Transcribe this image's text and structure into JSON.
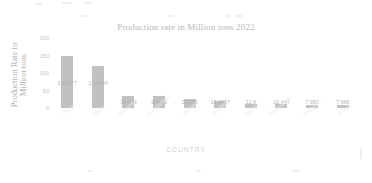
{
  "artifacts": {
    "note": "faint scan bleed marks"
  },
  "chart_data": {
    "type": "bar",
    "title": "Production rate in Million tons 2022",
    "xlabel": "COUNTRY",
    "ylabel": "Production Rate  in Million tons",
    "categories": [
      "China",
      "India",
      "Indonesia",
      "Bangladesh",
      "Vietnam",
      "Thailand",
      "Burma",
      "Philippines",
      "Pakistan",
      "Brazil"
    ],
    "values": [
      148.277,
      120.444,
      34.456,
      34.472,
      26.731,
      19.4617,
      12.6,
      10.447,
      7.992,
      7.666
    ],
    "value_labels": [
      "148.277",
      "120.444",
      "34.456",
      "34.472",
      "26.731",
      "19.4617",
      "12.6",
      "10.447",
      "7.992",
      "7.666"
    ],
    "yticks": [
      0,
      50,
      100,
      150,
      200
    ],
    "ytick_labels": [
      "0",
      "50",
      "100",
      "150",
      "200"
    ],
    "ylim": [
      0,
      200
    ],
    "grid": false,
    "legend": false,
    "series_color": "#b6b6b6"
  }
}
